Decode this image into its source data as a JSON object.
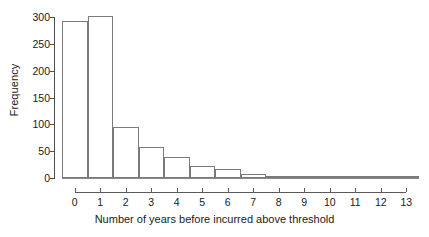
{
  "chart_data": {
    "type": "bar",
    "title": "",
    "subtitle": "",
    "xlabel": "Number of years before incurred above threshold",
    "ylabel": "Frequency",
    "categories": [
      "0",
      "1",
      "2",
      "3",
      "4",
      "5",
      "6",
      "7",
      "8",
      "9",
      "10",
      "11",
      "12",
      "13"
    ],
    "values": [
      292,
      302,
      95,
      57,
      39,
      22,
      17,
      8,
      2,
      2,
      3,
      1,
      0,
      1
    ],
    "xlim": [
      -0.5,
      13.5
    ],
    "ylim": [
      0,
      300
    ],
    "yticks": [
      0,
      50,
      100,
      150,
      200,
      250,
      300
    ],
    "ytick_labels": [
      "0",
      "50",
      "100",
      "150",
      "200",
      "250",
      "300"
    ],
    "xticks": [
      0,
      1,
      2,
      3,
      4,
      5,
      6,
      7,
      8,
      9,
      10,
      11,
      12,
      13
    ],
    "xtick_labels": [
      "0",
      "1",
      "2",
      "3",
      "4",
      "5",
      "6",
      "7",
      "8",
      "9",
      "10",
      "11",
      "12",
      "13"
    ],
    "grid": false,
    "legend": null,
    "bar_fill_color": "#ffffff",
    "bar_border_color": "#7a7a7a",
    "axis_color": "#4d4d4d",
    "text_color": "#1a1a1a",
    "background_color": "#ffffff"
  }
}
